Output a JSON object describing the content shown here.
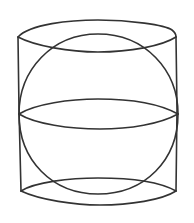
{
  "figure": {
    "stroke_color": "#333333",
    "background": "#ffffff",
    "stroke_width": 1.6
  },
  "shapes": {
    "cylinder": {
      "top_ellipse": {
        "left": [
          18,
          37
        ],
        "right": [
          176,
          37
        ],
        "back_y": 21,
        "front_y": 52
      },
      "bottom_ellipse": {
        "left": [
          21,
          191
        ],
        "right": [
          176,
          191
        ],
        "back_y": 178,
        "front_y": 205
      },
      "left_edge": {
        "x": 18,
        "y1": 37,
        "y2": 191
      },
      "right_edge": {
        "x": 176,
        "y1": 37,
        "y2": 191
      }
    },
    "sphere": {
      "center": [
        98,
        114
      ],
      "radius_x": 79,
      "radius_y": 80,
      "equator": {
        "left": [
          19,
          114
        ],
        "right": [
          178,
          114
        ],
        "back_y": 99,
        "front_y": 128
      }
    }
  }
}
